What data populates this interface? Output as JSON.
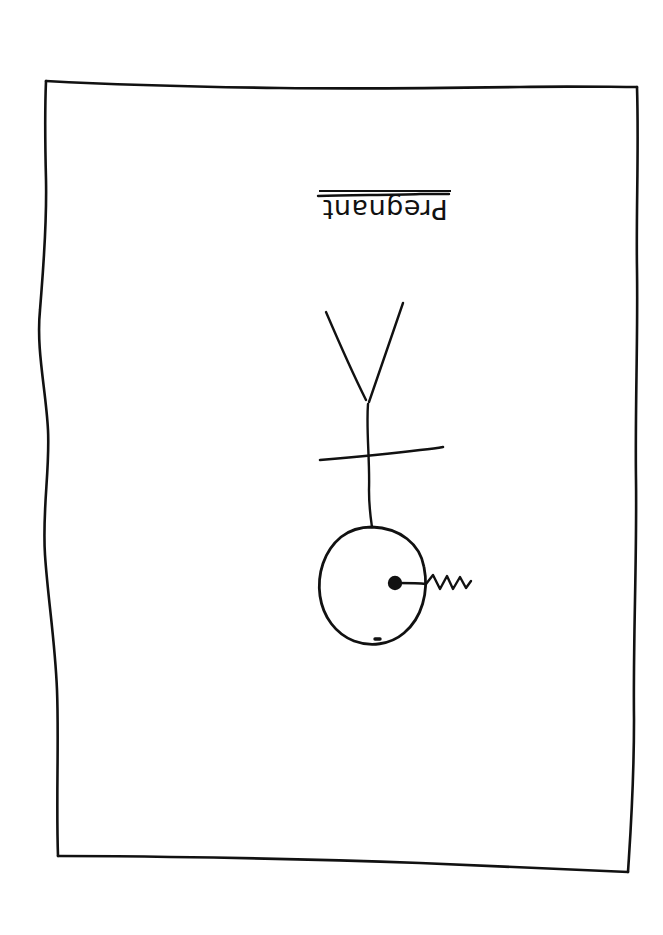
{
  "artwork": {
    "medium": "ink-line-drawing",
    "background_color": "#ffffff",
    "ink_color": "#111111",
    "caption": {
      "text": "Pregnant",
      "orientation": "rotated-180",
      "underline": true
    },
    "figure": {
      "description": "upside-down stick figure",
      "parts": [
        "legs-v",
        "torso-line",
        "arms-line",
        "head-circle",
        "navel-dot",
        "squiggle-cord"
      ]
    },
    "border": {
      "description": "hand-drawn wobbly rectangle frame"
    }
  },
  "geometry": {
    "frame": {
      "top_left": [
        46,
        80
      ],
      "top_right": [
        637,
        87
      ],
      "bottom_right": [
        628,
        872
      ],
      "bottom_left": [
        58,
        856
      ]
    },
    "legs": {
      "apex": [
        368,
        404
      ],
      "left_tip": [
        326,
        312
      ],
      "right_tip": [
        403,
        303
      ]
    },
    "torso": {
      "from": [
        368,
        404
      ],
      "to": [
        372,
        527
      ]
    },
    "arms": {
      "from": [
        320,
        460
      ],
      "to": [
        443,
        448
      ]
    },
    "head_circle": {
      "center": [
        372,
        585
      ],
      "radius_x": 53,
      "radius_y": 59
    },
    "navel_dot": {
      "center": [
        395,
        583
      ],
      "radius": 7
    },
    "cord": {
      "from": [
        395,
        583
      ],
      "to": [
        472,
        584
      ]
    },
    "chin_node": {
      "center": [
        377,
        638
      ]
    },
    "caption_rule": {
      "from": [
        318,
        196
      ],
      "to": [
        449,
        194
      ]
    }
  }
}
